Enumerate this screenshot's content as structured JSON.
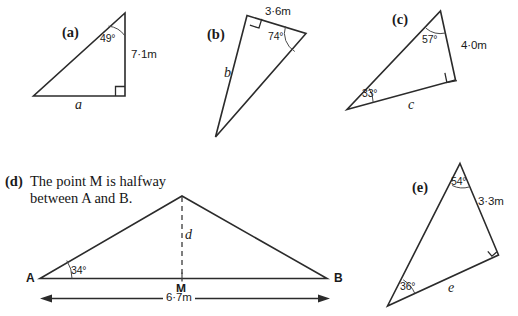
{
  "page": {
    "width": 518,
    "height": 316,
    "background": "#ffffff",
    "ink": "#2b2b2b"
  },
  "parts": {
    "a": {
      "tag": "(a)",
      "angle": "49°",
      "side_measure": "7·1m",
      "side_var": "a",
      "right_angle": true
    },
    "b": {
      "tag": "(b)",
      "angle": "74°",
      "side_measure": "3·6m",
      "side_var": "b",
      "right_angle": true
    },
    "c": {
      "tag": "(c)",
      "angle_top": "57°",
      "angle_left": "33°",
      "side_measure": "4·0m",
      "side_var": "c",
      "right_angle": true
    },
    "d": {
      "tag": "(d)",
      "prompt_line1": "The point M is halfway",
      "prompt_line2": "between A and B.",
      "angle": "34°",
      "height_var": "d",
      "vertex_a": "A",
      "vertex_b": "B",
      "vertex_m": "M",
      "base_measure": "6·7m"
    },
    "e": {
      "tag": "(e)",
      "angle_top": "54°",
      "angle_bottom": "36°",
      "side_measure": "3·3m",
      "side_var": "e",
      "right_angle": true
    }
  }
}
